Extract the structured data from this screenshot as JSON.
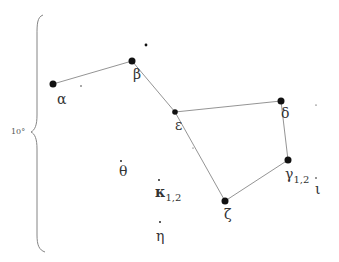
{
  "diagram": {
    "scale_label": "10°",
    "line_color": "#888888",
    "star_color": "#111111",
    "stars": [
      {
        "id": "alpha",
        "label": "α",
        "x": 53,
        "y": 84,
        "r": 3.5,
        "lx": 57,
        "ly": 92
      },
      {
        "id": "beta",
        "label": "β",
        "x": 132,
        "y": 61,
        "r": 3.5,
        "lx": 133,
        "ly": 67
      },
      {
        "id": "epsilon",
        "label": "ε",
        "x": 175,
        "y": 112,
        "r": 2.8,
        "lx": 175,
        "ly": 118
      },
      {
        "id": "delta",
        "label": "δ",
        "x": 281,
        "y": 101,
        "r": 3.5,
        "lx": 281,
        "ly": 106
      },
      {
        "id": "gamma",
        "label": "γ",
        "sub": "1,2",
        "x": 288,
        "y": 160,
        "r": 3.5,
        "lx": 285,
        "ly": 167
      },
      {
        "id": "zeta",
        "label": "ζ",
        "x": 225,
        "y": 201,
        "r": 3.5,
        "lx": 224,
        "ly": 207
      },
      {
        "id": "theta",
        "label": "θ",
        "x": 121,
        "y": 161,
        "r": 0.9,
        "lx": 119,
        "ly": 164
      },
      {
        "id": "kappa",
        "label": "κ",
        "sub": "1,2",
        "x": 159,
        "y": 180,
        "r": 0.9,
        "lx": 155,
        "ly": 185,
        "bold": true
      },
      {
        "id": "eta",
        "label": "η",
        "x": 160,
        "y": 222,
        "r": 0.9,
        "lx": 156,
        "ly": 229
      },
      {
        "id": "iota",
        "label": "ι",
        "x": 316,
        "y": 178,
        "r": 0.8,
        "lx": 315,
        "ly": 182
      }
    ],
    "minor_stars": [
      {
        "x": 146,
        "y": 45,
        "r": 1.4
      },
      {
        "x": 81,
        "y": 86,
        "r": 0.7
      },
      {
        "x": 316,
        "y": 105,
        "r": 0.6
      },
      {
        "x": 193,
        "y": 148,
        "r": 0.5
      }
    ],
    "lines": [
      [
        "alpha",
        "beta"
      ],
      [
        "beta",
        "epsilon"
      ],
      [
        "epsilon",
        "delta"
      ],
      [
        "delta",
        "gamma"
      ],
      [
        "gamma",
        "zeta"
      ],
      [
        "zeta",
        "epsilon"
      ]
    ]
  }
}
